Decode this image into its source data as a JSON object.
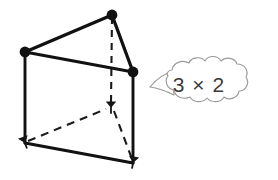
{
  "figure": {
    "kind": "geometry-diagram",
    "background_color": "#ffffff",
    "edge_color": "#111111",
    "hidden_edge_color": "#1a1a1a",
    "callout_outline_color": "#9a9a9a",
    "callout_fill_color": "#ffffff",
    "callout_text_color": "#3b3b3b"
  },
  "solid": {
    "name": "triangular prism",
    "vertices": [
      {
        "id": "top-left",
        "label": "top face left corner",
        "x": 25,
        "y": 52,
        "marker": "dot",
        "hidden": false
      },
      {
        "id": "top-apex",
        "label": "top face back corner",
        "x": 112,
        "y": 15,
        "marker": "dot",
        "hidden": false
      },
      {
        "id": "top-right",
        "label": "top face right corner",
        "x": 133,
        "y": 72,
        "marker": "dot",
        "hidden": false
      },
      {
        "id": "bottom-left",
        "label": "bottom face left corner",
        "x": 25,
        "y": 143,
        "marker": "arrow",
        "hidden": false
      },
      {
        "id": "bottom-back",
        "label": "bottom face back corner",
        "x": 111,
        "y": 108,
        "marker": "arrow",
        "hidden": true
      },
      {
        "id": "bottom-right",
        "label": "bottom face right corner",
        "x": 133,
        "y": 163,
        "marker": "arrow",
        "hidden": false
      }
    ],
    "edges": [
      {
        "id": "top-left-to-apex",
        "from": "top-left",
        "to": "top-apex",
        "style": "solid"
      },
      {
        "id": "apex-to-top-right",
        "from": "top-apex",
        "to": "top-right",
        "style": "solid"
      },
      {
        "id": "top-right-to-top-left",
        "from": "top-right",
        "to": "top-left",
        "style": "solid"
      },
      {
        "id": "left-vertical",
        "from": "top-left",
        "to": "bottom-left",
        "style": "solid"
      },
      {
        "id": "right-vertical",
        "from": "top-right",
        "to": "bottom-right",
        "style": "solid"
      },
      {
        "id": "back-vertical",
        "from": "top-apex",
        "to": "bottom-back",
        "style": "dashed"
      },
      {
        "id": "bottom-left-to-right",
        "from": "bottom-left",
        "to": "bottom-right",
        "style": "solid"
      },
      {
        "id": "bottom-left-to-back",
        "from": "bottom-left",
        "to": "bottom-back",
        "style": "dashed"
      },
      {
        "id": "bottom-back-to-right",
        "from": "bottom-back",
        "to": "bottom-right",
        "style": "dashed"
      }
    ]
  },
  "callout": {
    "text": "3 × 2",
    "shape": "cloud-speech-bubble",
    "tail_direction": "left",
    "bounds": {
      "x": 150,
      "y": 61,
      "width": 97,
      "height": 42
    },
    "text_position": {
      "x": 199,
      "y": 90
    }
  }
}
